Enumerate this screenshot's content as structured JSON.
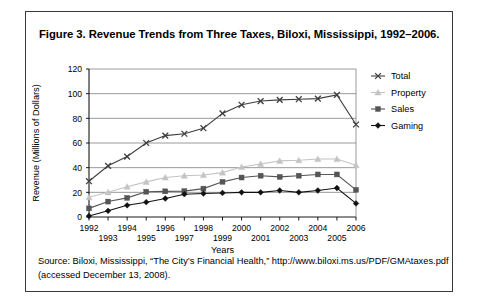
{
  "figure": {
    "title": "Figure 3. Revenue Trends from Three Taxes, Biloxi, Mississippi, 1992–2006.",
    "source_line1": "Source: Biloxi, Mississippi, “The City’s Financial Health,” http://www.biloxi.ms.us/PDF/GMAtaxes.pdf",
    "source_line2": "(accessed December 13, 2008)."
  },
  "chart_data": {
    "type": "line",
    "title": "Figure 3. Revenue Trends from Three Taxes, Biloxi, Mississippi, 1992–2006.",
    "xlabel": "Years",
    "ylabel": "Revenue (Millions of Dollars)",
    "categories": [
      "1992",
      "1993",
      "1994",
      "1995",
      "1996",
      "1997",
      "1998",
      "1999",
      "2000",
      "2001",
      "2002",
      "2003",
      "2004",
      "2005",
      "2006"
    ],
    "x_tick_labels": [
      "1992",
      "1993",
      "1994",
      "1995",
      "1996",
      "1997",
      "1998",
      "1999",
      "2000",
      "2001",
      "2002",
      "2003",
      "2004",
      "2005",
      "2006"
    ],
    "y_tick_labels": [
      "0",
      "20",
      "40",
      "60",
      "80",
      "100",
      "120"
    ],
    "y_ticks": [
      0,
      20,
      40,
      60,
      80,
      100,
      120
    ],
    "ylim": [
      0,
      120
    ],
    "grid": "horizontal",
    "legend_position": "right",
    "series": [
      {
        "name": "Total",
        "marker": "x-cross",
        "color": "#3f3f3f",
        "values": [
          29,
          41.5,
          49,
          60,
          66,
          67.5,
          72,
          84,
          91,
          94,
          95,
          95.5,
          96,
          99,
          75
        ]
      },
      {
        "name": "Property",
        "marker": "triangle",
        "color": "#c4c4c4",
        "values": [
          16,
          20,
          24.5,
          28.5,
          32,
          33.5,
          34,
          36,
          40.5,
          43,
          45.5,
          46,
          47,
          47,
          42
        ]
      },
      {
        "name": "Sales",
        "marker": "square",
        "color": "#555555",
        "values": [
          7,
          12.5,
          15.5,
          20.5,
          20.8,
          21,
          23,
          28.5,
          32,
          33.5,
          32.5,
          33.5,
          34.5,
          34.5,
          22
        ]
      },
      {
        "name": "Gaming",
        "marker": "diamond",
        "color": "#111111",
        "values": [
          0.8,
          5,
          9.5,
          12,
          15,
          18.5,
          19,
          19.5,
          20,
          20,
          21.5,
          20,
          21.5,
          23.5,
          11
        ]
      }
    ]
  },
  "legend": {
    "items": [
      {
        "label": "Total",
        "marker": "x-cross",
        "color": "#3f3f3f"
      },
      {
        "label": "Property",
        "marker": "triangle",
        "color": "#c4c4c4"
      },
      {
        "label": "Sales",
        "marker": "square",
        "color": "#555555"
      },
      {
        "label": "Gaming",
        "marker": "diamond",
        "color": "#111111"
      }
    ]
  }
}
